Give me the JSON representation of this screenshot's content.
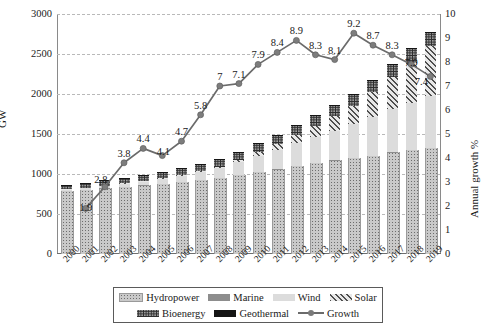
{
  "chart_data": {
    "type": "bar",
    "title": "",
    "subtitle": "",
    "xlabel": "",
    "ylabel": "GW",
    "ylabel_secondary": "Annual growth %",
    "ylim": [
      0,
      3000
    ],
    "ylim_secondary": [
      0,
      10
    ],
    "yticks": [
      3000,
      2500,
      2000,
      1500,
      1000,
      500,
      0
    ],
    "yticks_secondary": [
      10,
      9,
      8,
      7,
      6,
      5,
      4,
      3,
      2,
      1,
      0
    ],
    "grid": true,
    "legend_position": "bottom",
    "categories": [
      "2000",
      "2001",
      "2002",
      "2003",
      "2004",
      "2005",
      "2006",
      "2007",
      "2008",
      "2009",
      "2010",
      "2011",
      "2012",
      "2013",
      "2014",
      "2015",
      "2016",
      "2017",
      "2018",
      "2019"
    ],
    "series": [
      {
        "name": "Hydropower",
        "pattern": "light-dotted",
        "color": "#c9c9c9",
        "values": [
          790,
          805,
          820,
          840,
          860,
          880,
          905,
          930,
          955,
          990,
          1030,
          1060,
          1100,
          1140,
          1170,
          1200,
          1230,
          1270,
          1300,
          1330
        ]
      },
      {
        "name": "Marine",
        "pattern": "solid-gray",
        "color": "#8d8d8d",
        "values": [
          1,
          1,
          1,
          1,
          1,
          1,
          1,
          1,
          1,
          1,
          1,
          1,
          1,
          1,
          1,
          1,
          1,
          1,
          1,
          1
        ]
      },
      {
        "name": "Wind",
        "pattern": "light-solid",
        "color": "#dcdcdc",
        "values": [
          17,
          24,
          31,
          39,
          47,
          59,
          74,
          94,
          121,
          159,
          198,
          238,
          283,
          319,
          370,
          425,
          487,
          540,
          591,
          650
        ]
      },
      {
        "name": "Solar",
        "pattern": "diagonal-hatch",
        "color": "#e8e8e8",
        "values": [
          1,
          1,
          2,
          3,
          4,
          5,
          7,
          9,
          16,
          24,
          42,
          73,
          104,
          141,
          180,
          229,
          301,
          398,
          512,
          621
        ]
      },
      {
        "name": "Bioenergy",
        "pattern": "dark-dotted",
        "color": "#9b9b9b",
        "values": [
          52,
          55,
          59,
          63,
          67,
          71,
          76,
          81,
          87,
          93,
          100,
          108,
          115,
          122,
          129,
          136,
          142,
          148,
          154,
          160
        ]
      },
      {
        "name": "Geothermal",
        "pattern": "solid-black",
        "color": "#151515",
        "values": [
          8,
          8,
          8,
          9,
          9,
          9,
          10,
          10,
          10,
          11,
          11,
          11,
          11,
          12,
          12,
          13,
          13,
          14,
          14,
          14
        ]
      }
    ],
    "line_series": {
      "name": "Growth",
      "axis": "secondary",
      "color": "#6b6b6b",
      "values": [
        null,
        1.9,
        2.8,
        3.8,
        4.4,
        4.1,
        4.7,
        5.8,
        7,
        7.1,
        7.9,
        8.4,
        8.9,
        8.3,
        8.1,
        9.2,
        8.7,
        8.3,
        7.9,
        7.4
      ],
      "labels": [
        "",
        "1.9",
        "2.8",
        "3.8",
        "4.4",
        "4.1",
        "4.7",
        "5.8",
        "7",
        "7.1",
        "7.9",
        "8.4",
        "8.9",
        "8.3",
        "8.1",
        "9.2",
        "8.7",
        "8.3",
        "7.9",
        "7.4"
      ]
    },
    "legend": [
      {
        "label": "Hydropower",
        "swatch": "sw-hydro"
      },
      {
        "label": "Marine",
        "swatch": "sw-marine"
      },
      {
        "label": "Wind",
        "swatch": "sw-wind"
      },
      {
        "label": "Solar",
        "swatch": "sw-solar"
      },
      {
        "label": "Bioenergy",
        "swatch": "sw-bio"
      },
      {
        "label": "Geothermal",
        "swatch": "sw-geo"
      },
      {
        "label": "Growth",
        "swatch": "sw-growth"
      }
    ]
  }
}
